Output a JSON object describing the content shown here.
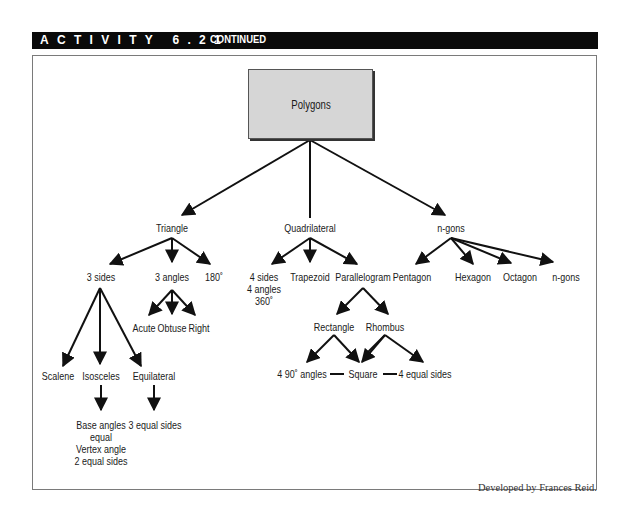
{
  "header": {
    "activity": "ACTIVITY 6.21",
    "continued": "CONTINUED",
    "bar_color": "#0a0a0a"
  },
  "diagram": {
    "root": "Polygons",
    "level1": {
      "triangle": "Triangle",
      "quadrilateral": "Quadrilateral",
      "ngons": "n-gons"
    },
    "triangle": {
      "sides": "3 sides",
      "angles": "3 angles",
      "sum": "180˚",
      "angle_types": [
        "Acute",
        "Obtuse",
        "Right"
      ],
      "side_types": [
        "Scalene",
        "Isosceles",
        "Equilateral"
      ],
      "isosceles_props": [
        "Base angles",
        "equal",
        "Vertex angle",
        "2 equal sides"
      ],
      "equilateral_props": "3 equal sides"
    },
    "quadrilateral": {
      "props": [
        "4 sides",
        "4 angles",
        "360˚"
      ],
      "trapezoid": "Trapezoid",
      "parallelogram": "Parallelogram",
      "rectangle": "Rectangle",
      "rhombus": "Rhombus",
      "right_angles": "4 90˚ angles",
      "square": "Square",
      "equal_sides": "4 equal sides"
    },
    "ngons": {
      "children": [
        "Pentagon",
        "Hexagon",
        "Octagon",
        "n-gons"
      ]
    }
  },
  "footer": {
    "credit": "Developed by Frances Reid."
  }
}
